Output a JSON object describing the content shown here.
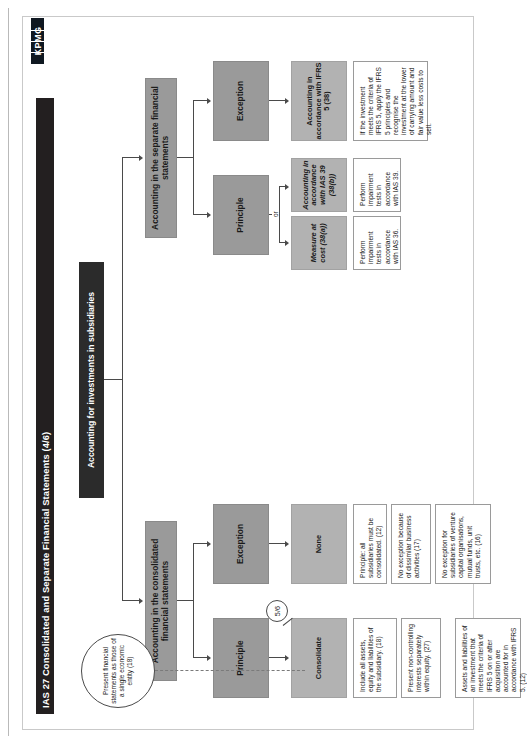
{
  "document": {
    "title": "IAS 27 Consolidated and Separate Financial Statements (4/6)",
    "logo_text": "KPMG"
  },
  "diagram": {
    "root": "Accounting for investments in subsidiaries",
    "note_oval": "Present financial statements as those of a single economic entity (18)",
    "branch_left": {
      "header": "Accounting in the consolidated financial statements",
      "principle": {
        "label": "Principle",
        "action": "Consolidate",
        "badge": "5/6",
        "details": [
          "Include all assets, equity and liabilities of the subsidiary. (18)",
          "Present non-controlling interests separately within equity. (27)",
          "Assets and liabilities of an investment that meets the criteria of IFRS 5 on or after acquisition are accounted for in accordance with IFRS 5. (12)"
        ]
      },
      "exception": {
        "label": "Exception",
        "action": "None",
        "details": [
          "Principle: all subsidiaries must be consolidated. (12)",
          "No exception because of dissimilar business activities (17)",
          "No exception for subsidiaries of venture capital organisations, mutual funds, unit trusts, etc. (16)"
        ]
      }
    },
    "branch_right": {
      "header": "Accounting in the separate financial statements",
      "principle": {
        "label": "Principle",
        "or_label": "or",
        "options": [
          {
            "action": "Measure at cost (38(a))",
            "detail": "Perform impairment tests in accordance with IAS 36."
          },
          {
            "action": "Accounting in accordance with IAS 39 (38(b))",
            "detail": "Perform impairment tests in accordance with IAS 39."
          }
        ]
      },
      "exception": {
        "label": "Exception",
        "action": "Accounting in accordance with IFRS 5 (38)",
        "detail": "If the investment meets the criteria of IFRS 5, apply the IFRS 5 principles and recognise the investment at the lower of carrying amount and fair value less costs to sell."
      }
    }
  }
}
